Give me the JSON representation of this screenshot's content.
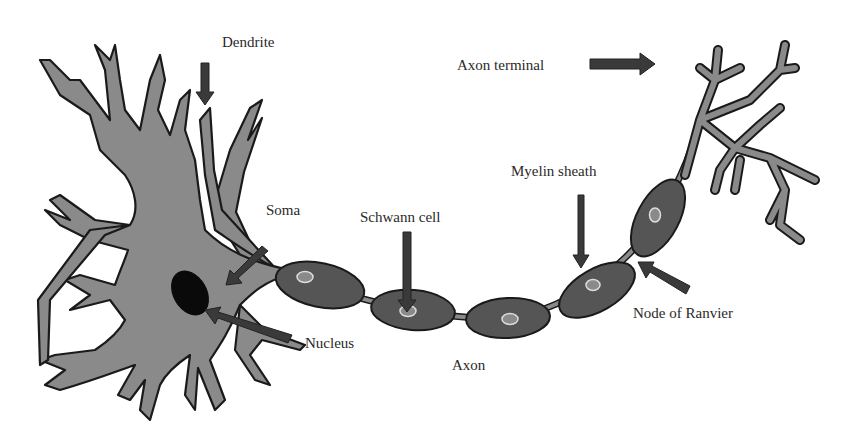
{
  "diagram": {
    "colors": {
      "cell_fill": "#8a8a8a",
      "outline": "#1a1a1a",
      "myelin_fill": "#555555",
      "nucleus": "#0a0a0a",
      "arrow": "#3a3a3a",
      "text": "#2a2a2a"
    },
    "labels": {
      "dendrite": "Dendrite",
      "soma": "Soma",
      "nucleus": "Nucleus",
      "schwann_cell": "Schwann cell",
      "axon": "Axon",
      "myelin_sheath": "Myelin sheath",
      "node_of_ranvier": "Node of Ranvier",
      "axon_terminal": "Axon terminal"
    }
  }
}
